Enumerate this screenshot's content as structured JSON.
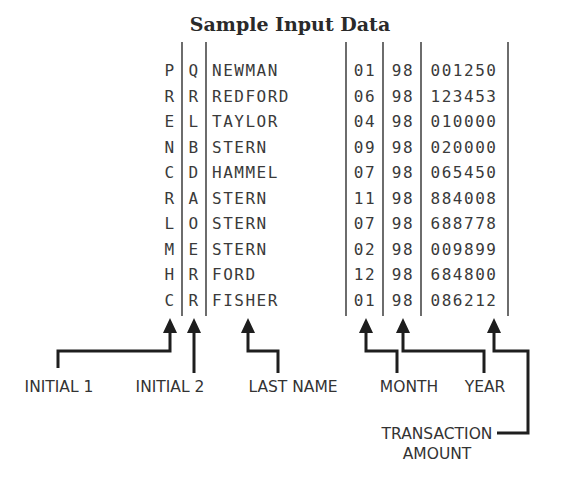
{
  "title": "Sample Input Data",
  "table": {
    "columns": [
      "initial_1",
      "initial_2",
      "last_name",
      "month",
      "year",
      "transaction_amount"
    ],
    "rows": [
      {
        "initial_1": "P",
        "initial_2": "Q",
        "last_name": "NEWMAN",
        "month": "01",
        "year": "98",
        "transaction_amount": "001250"
      },
      {
        "initial_1": "R",
        "initial_2": "R",
        "last_name": "REDFORD",
        "month": "06",
        "year": "98",
        "transaction_amount": "123453"
      },
      {
        "initial_1": "E",
        "initial_2": "L",
        "last_name": "TAYLOR",
        "month": "04",
        "year": "98",
        "transaction_amount": "010000"
      },
      {
        "initial_1": "N",
        "initial_2": "B",
        "last_name": "STERN",
        "month": "09",
        "year": "98",
        "transaction_amount": "020000"
      },
      {
        "initial_1": "C",
        "initial_2": "D",
        "last_name": "HAMMEL",
        "month": "07",
        "year": "98",
        "transaction_amount": "065450"
      },
      {
        "initial_1": "R",
        "initial_2": "A",
        "last_name": "STERN",
        "month": "11",
        "year": "98",
        "transaction_amount": "884008"
      },
      {
        "initial_1": "L",
        "initial_2": "O",
        "last_name": "STERN",
        "month": "07",
        "year": "98",
        "transaction_amount": "688778"
      },
      {
        "initial_1": "M",
        "initial_2": "E",
        "last_name": "STERN",
        "month": "02",
        "year": "98",
        "transaction_amount": "009899"
      },
      {
        "initial_1": "H",
        "initial_2": "R",
        "last_name": "FORD",
        "month": "12",
        "year": "98",
        "transaction_amount": "684800"
      },
      {
        "initial_1": "C",
        "initial_2": "R",
        "last_name": "FISHER",
        "month": "01",
        "year": "98",
        "transaction_amount": "086212"
      }
    ]
  },
  "labels": {
    "initial_1": "INITIAL 1",
    "initial_2": "INITIAL 2",
    "last_name": "LAST NAME",
    "month": "MONTH",
    "year": "YEAR",
    "transaction_line1": "TRANSACTION",
    "transaction_line2": "AMOUNT"
  },
  "colors": {
    "text": "#3a3a3a",
    "lines": "#1e1e1e",
    "background": "#ffffff"
  }
}
